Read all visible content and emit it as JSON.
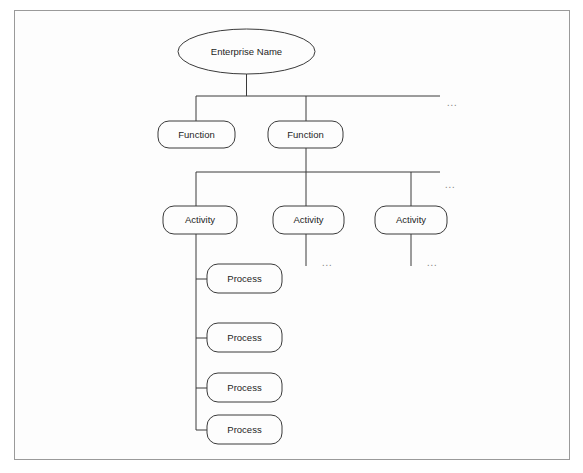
{
  "diagram": {
    "title_text": "",
    "background_color": "#fdfdfd",
    "frame_color": "#9a9a9a",
    "stroke_color": "#3a3a3a",
    "text_color": "#1d1d1d",
    "ellipsis_color": "#8d8d8d",
    "levels": [
      {
        "level_name": "enterprise",
        "shape": "ellipse",
        "nodes": [
          {
            "id": "enterprise-1",
            "label": "Enterprise Name",
            "cx": 246.5,
            "cy": 51.5,
            "rx": 68.5,
            "ry": 22.5
          }
        ]
      },
      {
        "level_name": "function",
        "shape": "rounded-rect",
        "nodes": [
          {
            "id": "function-1",
            "label": "Function",
            "x": 158,
            "y": 121,
            "w": 77,
            "h": 27
          },
          {
            "id": "function-2",
            "label": "Function",
            "x": 268,
            "y": 121,
            "w": 75,
            "h": 27
          }
        ],
        "ellipsis": {
          "label": "...",
          "x": 452,
          "y": 103
        }
      },
      {
        "level_name": "activity",
        "shape": "rounded-rect",
        "nodes": [
          {
            "id": "activity-1",
            "label": "Activity",
            "x": 163,
            "y": 206,
            "w": 74,
            "h": 28
          },
          {
            "id": "activity-2",
            "label": "Activity",
            "x": 273,
            "y": 206,
            "w": 71,
            "h": 28
          },
          {
            "id": "activity-3",
            "label": "Activity",
            "x": 375,
            "y": 206,
            "w": 72,
            "h": 28
          }
        ],
        "ellipsis": {
          "label": "...",
          "x": 450,
          "y": 185
        }
      },
      {
        "level_name": "process",
        "shape": "rounded-rect",
        "nodes": [
          {
            "id": "process-1",
            "label": "Process",
            "x": 207,
            "y": 264,
            "w": 75,
            "h": 29
          },
          {
            "id": "process-2",
            "label": "Process",
            "x": 207,
            "y": 323,
            "w": 75,
            "h": 29
          },
          {
            "id": "process-3",
            "label": "Process",
            "x": 207,
            "y": 373,
            "w": 75,
            "h": 29
          },
          {
            "id": "process-4",
            "label": "Process",
            "x": 207,
            "y": 415,
            "w": 75,
            "h": 29
          }
        ]
      }
    ],
    "sub_ellipses": [
      {
        "id": "activity-2-more",
        "label": "...",
        "x": 327,
        "y": 263
      },
      {
        "id": "activity-3-more",
        "label": "...",
        "x": 432,
        "y": 263
      }
    ]
  }
}
